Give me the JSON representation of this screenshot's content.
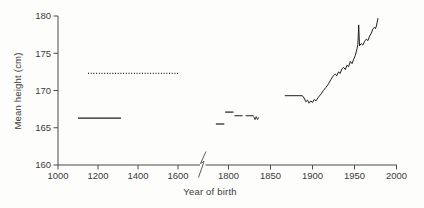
{
  "chart_data": {
    "type": "line",
    "title": "",
    "xlabel": "Year of birth",
    "ylabel": "Mean height (cm)",
    "grid": false,
    "legend": "none",
    "x_axis": {
      "ticks_left": [
        1000,
        1200,
        1400,
        1600
      ],
      "ticks_right": [
        1800,
        1850,
        1900,
        1950,
        2000
      ],
      "break_between": [
        1600,
        1800
      ],
      "note": "x-axis has a scale break between 1600 and 1800; right side is expanded (50-year ticks)"
    },
    "y_axis": {
      "ticks": [
        160,
        165,
        170,
        175,
        180
      ],
      "range": [
        160,
        180
      ]
    },
    "series": [
      {
        "name": "medieval-period-solid",
        "style": "solid",
        "stroke_width": 1.4,
        "points": [
          [
            1100,
            166.3
          ],
          [
            1315,
            166.3
          ]
        ]
      },
      {
        "name": "early-period-dotted",
        "style": "dotted",
        "stroke_width": 1.1,
        "points": [
          [
            1150,
            172.3
          ],
          [
            1605,
            172.3
          ]
        ]
      },
      {
        "name": "late-1700s-segment",
        "style": "solid",
        "stroke_width": 1.2,
        "points": [
          [
            1785,
            165.5
          ],
          [
            1795,
            165.5
          ]
        ]
      },
      {
        "name": "circa-1800-segment",
        "style": "solid",
        "stroke_width": 1.2,
        "points": [
          [
            1796,
            167.1
          ],
          [
            1806,
            167.1
          ]
        ]
      },
      {
        "name": "early-1800s-dashed",
        "style": "dashed",
        "stroke_width": 1.1,
        "points": [
          [
            1807,
            166.6
          ],
          [
            1830,
            166.6
          ]
        ]
      },
      {
        "name": "1830s-zigzag",
        "style": "solid",
        "stroke_width": 0.9,
        "points": [
          [
            1830,
            166.5
          ],
          [
            1831.5,
            166.1
          ],
          [
            1833,
            166.5
          ],
          [
            1834.5,
            166.1
          ],
          [
            1836,
            166.4
          ]
        ]
      },
      {
        "name": "modern-series",
        "style": "solid",
        "stroke_width": 1.0,
        "points": [
          [
            1867,
            169.3
          ],
          [
            1888,
            169.3
          ],
          [
            1890,
            169.0
          ],
          [
            1892,
            168.5
          ],
          [
            1894,
            168.7
          ],
          [
            1896,
            168.3
          ],
          [
            1898,
            168.6
          ],
          [
            1900,
            168.4
          ],
          [
            1902,
            168.8
          ],
          [
            1904,
            168.6
          ],
          [
            1907,
            169.1
          ],
          [
            1910,
            169.5
          ],
          [
            1913,
            170.0
          ],
          [
            1916,
            170.4
          ],
          [
            1919,
            170.9
          ],
          [
            1922,
            171.5
          ],
          [
            1925,
            172.0
          ],
          [
            1927,
            172.2
          ],
          [
            1929,
            172.0
          ],
          [
            1931,
            172.5
          ],
          [
            1933,
            172.3
          ],
          [
            1935,
            172.9
          ],
          [
            1937,
            173.1
          ],
          [
            1939,
            172.8
          ],
          [
            1941,
            173.4
          ],
          [
            1943,
            173.2
          ],
          [
            1945,
            173.9
          ],
          [
            1947,
            173.6
          ],
          [
            1949,
            174.2
          ],
          [
            1951,
            174.7
          ],
          [
            1953,
            175.6
          ],
          [
            1954,
            176.2
          ],
          [
            1955,
            178.8
          ],
          [
            1956,
            176.0
          ],
          [
            1958,
            176.3
          ],
          [
            1960,
            176.1
          ],
          [
            1962,
            176.6
          ],
          [
            1964,
            176.9
          ],
          [
            1966,
            176.7
          ],
          [
            1968,
            177.3
          ],
          [
            1970,
            177.7
          ],
          [
            1972,
            178.3
          ],
          [
            1974,
            178.5
          ],
          [
            1975,
            178.3
          ],
          [
            1976,
            178.6
          ],
          [
            1978,
            179.7
          ]
        ]
      }
    ]
  },
  "colors": {
    "background": "#fdfdfb",
    "axis": "#4a4a4a",
    "line": "#1f1f1f",
    "text": "#3a3a3a"
  }
}
